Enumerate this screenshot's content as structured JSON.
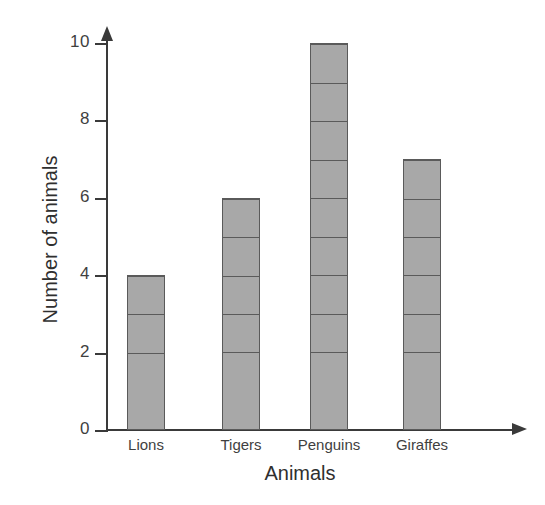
{
  "chart_data": {
    "type": "bar",
    "title": "",
    "subtitle": "",
    "xlabel": "Animals",
    "ylabel": "Number of animals",
    "categories": [
      "Lions",
      "Tigers",
      "Penguins",
      "Giraffes"
    ],
    "values": [
      4,
      6,
      10,
      7
    ],
    "ylim": [
      0,
      10
    ],
    "y_ticks": [
      0,
      2,
      4,
      6,
      8,
      10
    ],
    "y_tick_labels": [
      "0",
      "2",
      "4",
      "6",
      "8",
      "10"
    ],
    "y_tick_step": 2,
    "x_ticks": [],
    "grid": false,
    "legend": null,
    "legend_position": "none",
    "annotations": [],
    "style": {
      "bar_fill": "#a8a8a8",
      "bar_border": "#5a5a5a",
      "axis_color": "#3a3a3a",
      "text_color": "#3f3f3f",
      "title_color": "#2f2f2f",
      "background": "#ffffff",
      "segmented_units": true,
      "unit_size": 1,
      "axis_arrows": true
    }
  },
  "axes": {
    "y_title": "Number of animals",
    "x_title": "Animals"
  }
}
